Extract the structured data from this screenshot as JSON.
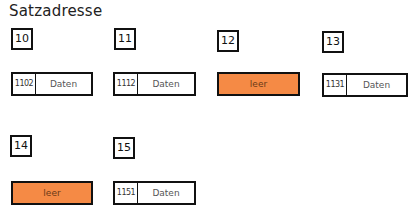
{
  "title": "Satzadresse",
  "colors": {
    "empty_fill": "#f58a45",
    "border": "#111111"
  },
  "slots": [
    {
      "index": "10",
      "key": "1102",
      "value": "Daten",
      "empty": false
    },
    {
      "index": "11",
      "key": "1112",
      "value": "Daten",
      "empty": false
    },
    {
      "index": "12",
      "key": "",
      "value": "leer",
      "empty": true
    },
    {
      "index": "13",
      "key": "1131",
      "value": "Daten",
      "empty": false
    },
    {
      "index": "14",
      "key": "",
      "value": "leer",
      "empty": true
    },
    {
      "index": "15",
      "key": "1151",
      "value": "Daten",
      "empty": false
    }
  ]
}
